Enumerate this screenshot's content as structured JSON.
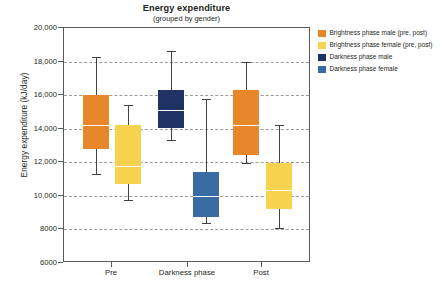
{
  "chart_data": {
    "type": "box",
    "title": "Energy expenditure",
    "subtitle": "(grouped by gender)",
    "xlabel": "",
    "ylabel": "Energy expenditure (kJ/day)",
    "ylim": [
      6000,
      20000
    ],
    "yticks": [
      "6000",
      "8000",
      "10,000",
      "12,000",
      "14,000",
      "16,000",
      "18,000",
      "20,000"
    ],
    "ytick_values": [
      6000,
      8000,
      10000,
      12000,
      14000,
      16000,
      18000,
      20000
    ],
    "grid": "horizontal-dashed",
    "legend_position": "right-outside",
    "categories": [
      "Pre",
      "Darkness phase",
      "Post"
    ],
    "series": [
      {
        "name": "Brightness phase male (pre, post)",
        "color": "#e8862a",
        "boxes": [
          {
            "category": "Pre",
            "whisker_low": 11300,
            "q1": 12800,
            "median": 14200,
            "q3": 16000,
            "whisker_high": 18300
          },
          {
            "category": "Post",
            "whisker_low": 12100,
            "q1": 12450,
            "median": 14200,
            "q3": 16300,
            "whisker_high": 18000
          }
        ]
      },
      {
        "name": "Brightness phase female (pre, post)",
        "color": "#f7d24f",
        "boxes": [
          {
            "category": "Pre",
            "whisker_low": 11300,
            "q1": 10700,
            "median": 11750,
            "q3": 14250,
            "whisker_high": 15400
          },
          {
            "category": "Post",
            "whisker_low": 8100,
            "q1": 9200,
            "median": 10350,
            "q3": 11950,
            "whisker_high": 14200
          }
        ]
      },
      {
        "name": "Darkness phase male",
        "color": "#1f3264",
        "boxes": [
          {
            "category": "Darkness phase",
            "whisker_low": 14600,
            "q1": 14050,
            "median": 16000,
            "q3": 16300,
            "whisker_high": 18650
          }
        ]
      },
      {
        "name": "Darkness phase female",
        "color": "#3b6ba5",
        "boxes": [
          {
            "category": "Darkness phase",
            "whisker_low": 11600,
            "q1": 8750,
            "median": 10000,
            "q3": 11400,
            "whisker_high": 15800
          }
        ]
      }
    ],
    "boxes_layout": [
      {
        "series": 0,
        "label": "Brightness phase male (pre, post)",
        "color": "#e8862a",
        "center_px": 95,
        "whisker_high": 18300,
        "q3": 16000,
        "median": 14200,
        "q1": 12800,
        "whisker_low": 11300
      },
      {
        "series": 1,
        "label": "Brightness phase female (pre, post)",
        "color": "#f7d24f",
        "center_px": 127,
        "whisker_high": 15400,
        "q3": 14250,
        "median": 11750,
        "q1": 10700,
        "whisker_low": 9750
      },
      {
        "series": 2,
        "label": "Darkness phase male",
        "color": "#1f3264",
        "center_px": 170,
        "whisker_high": 18650,
        "q3": 16300,
        "median": 15100,
        "q1": 14050,
        "whisker_low": 13350
      },
      {
        "series": 3,
        "label": "Darkness phase female",
        "color": "#3b6ba5",
        "center_px": 205,
        "whisker_high": 15800,
        "q3": 11400,
        "median": 10000,
        "q1": 8750,
        "whisker_low": 8400
      },
      {
        "series": 0,
        "label": "Brightness phase male (pre, post)",
        "color": "#e8862a",
        "center_px": 245,
        "whisker_high": 18000,
        "q3": 16300,
        "median": 14200,
        "q1": 12450,
        "whisker_low": 11950
      },
      {
        "series": 1,
        "label": "Brightness phase female (pre, post)",
        "color": "#f7d24f",
        "center_px": 278,
        "whisker_high": 14200,
        "q3": 11950,
        "median": 10350,
        "q1": 9200,
        "whisker_low": 8100
      }
    ]
  },
  "legend": {
    "items": [
      {
        "label": "Brightness phase male (pre, post)",
        "color": "#e8862a"
      },
      {
        "label": "Brightness phase female (pre, post)",
        "color": "#f7d24f"
      },
      {
        "label": "Darkness phase male",
        "color": "#1f3264"
      },
      {
        "label": "Darkness phase female",
        "color": "#3b6ba5"
      }
    ]
  }
}
